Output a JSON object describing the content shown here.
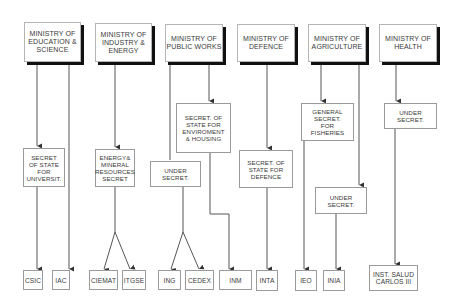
{
  "ministries": [
    {
      "label": "MINISTRY OF\nEDUCATION &\nSCIENCE"
    },
    {
      "label": "MINISTRY OF\nINDUSTRY &\nENERGY"
    },
    {
      "label": "MINISTRY OF\nPUBLIC WORKS"
    },
    {
      "label": "MINISTRY OF\nDEFENCE"
    },
    {
      "label": "MINISTRY OF\nAGRICULTURE"
    },
    {
      "label": "MINISTRY OF\nHEALTH"
    }
  ],
  "secretariats": [
    {
      "label": "SECRET\nOF STATE\nFOR\nUNIVERSIT."
    },
    {
      "label": "ENERGY&\nMINERAL\nRESOURCES\nSECRET"
    },
    {
      "label": "UNDER\nSECRET."
    },
    {
      "label": "SECRET. OF\nSTATE FOR\nENVIROMENT\n& HOUSING"
    },
    {
      "label": "SECRET. OF\nSTATE FOR\nDEFENCE"
    },
    {
      "label": "GENERAL\nSECRET.\nFOR\nFISHERIES"
    },
    {
      "label": "UNDER\nSECRET."
    },
    {
      "label": "UNDER\nSECRET."
    }
  ],
  "institutes": [
    {
      "label": "CSIC"
    },
    {
      "label": "IAC"
    },
    {
      "label": "CIEMAT"
    },
    {
      "label": "ITGSE"
    },
    {
      "label": "ING"
    },
    {
      "label": "CEDEX"
    },
    {
      "label": "INM"
    },
    {
      "label": "INTA"
    },
    {
      "label": "IEO"
    },
    {
      "label": "INIA"
    },
    {
      "label": "INST. SALUD\nCARLOS III"
    }
  ]
}
